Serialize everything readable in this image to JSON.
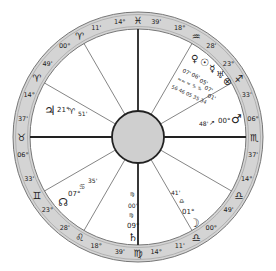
{
  "wheel": {
    "center": [
      138,
      137
    ],
    "outer_radius": 125,
    "inner_radius": 108,
    "hub_radius": 26,
    "ring_color": "#d4d4d4",
    "hub_color": "#cfcfcf"
  },
  "cusps": [
    {
      "id": "mc",
      "angle": 90,
      "heavy": true,
      "deg": "14°",
      "sign": "♓",
      "min": "39'"
    },
    {
      "id": "c11",
      "angle": 60,
      "heavy": false,
      "deg": "18°",
      "sign": "♒",
      "min": "28'"
    },
    {
      "id": "c12",
      "angle": 30,
      "heavy": false,
      "deg": "23°",
      "sign": "♐",
      "min": "33'"
    },
    {
      "id": "dsc",
      "angle": 0,
      "heavy": true,
      "deg": "06°",
      "sign": "♏",
      "min": "37'"
    },
    {
      "id": "c2r",
      "angle": -30,
      "heavy": false,
      "deg": "14°",
      "sign": "♎",
      "min": "49'"
    },
    {
      "id": "c3r",
      "angle": -60,
      "heavy": false,
      "deg": "00°",
      "sign": "♎",
      "min": "11'"
    },
    {
      "id": "ic",
      "angle": -90,
      "heavy": true,
      "deg": "14°",
      "sign": "♍",
      "min": "39'"
    },
    {
      "id": "c5",
      "angle": -120,
      "heavy": false,
      "deg": "18°",
      "sign": "♌",
      "min": "28'"
    },
    {
      "id": "c6",
      "angle": -150,
      "heavy": false,
      "deg": "23°",
      "sign": "♊",
      "min": "33'"
    },
    {
      "id": "asc",
      "angle": 180,
      "heavy": true,
      "deg": "06°",
      "sign": "♉",
      "min": "37'"
    },
    {
      "id": "c8",
      "angle": 150,
      "heavy": false,
      "deg": "14°",
      "sign": "♈",
      "min": "49'"
    },
    {
      "id": "c9",
      "angle": 120,
      "heavy": false,
      "deg": "00°",
      "sign": "♈",
      "min": "11'"
    }
  ],
  "planets": [
    {
      "name": "Jupiter",
      "glyph": "♃",
      "x": 44,
      "y": 112,
      "pos": "21° ♈ 51'"
    },
    {
      "name": "Mars",
      "glyph": "♂",
      "x": 235,
      "y": 100,
      "pos": "48' ↗ 00°"
    },
    {
      "name": "Moon",
      "glyph": "☽",
      "x": 193,
      "y": 220,
      "pos": "01° ♎ 41'"
    },
    {
      "name": "Saturn",
      "glyph": "♄",
      "x": 133,
      "y": 236,
      "pos": "09° ♍ 00'"
    },
    {
      "name": "North Node",
      "glyph": "☊",
      "x": 63,
      "y": 200,
      "pos": "07° ♋ 35'"
    },
    {
      "name": "Venus",
      "glyph": "♀",
      "x": 193,
      "y": 57,
      "pos": "07° ♒"
    },
    {
      "name": "Sun",
      "glyph": "☉",
      "x": 203,
      "y": 62,
      "pos": "06° ♒"
    },
    {
      "name": "Mercury",
      "glyph": "☿",
      "x": 212,
      "y": 69,
      "pos": "05° ♒"
    },
    {
      "name": "Uranus",
      "glyph": "♅",
      "x": 219,
      "y": 75,
      "pos": "07° ♑"
    },
    {
      "name": "Fortune",
      "glyph": "⊗",
      "x": 226,
      "y": 82,
      "pos": "01° ♑"
    }
  ],
  "texts": {
    "jup_deg": "21°",
    "jup_sign": "♈",
    "jup_min": "51'",
    "mars_min": "48'",
    "mars_arrow": "↗",
    "mars_deg": "00°",
    "moon_min": "41'",
    "moon_sign": "♎",
    "moon_deg": "01°",
    "sat_sign_top": "♍",
    "sat_min": "00'",
    "sat_sign": "♍",
    "sat_deg": "09°",
    "node_deg": "07°",
    "node_sign": "♋",
    "node_min": "35'",
    "stellium_a": "07'",
    "stellium_b": "06'",
    "stellium_c": "05'",
    "stellium_d": "07'",
    "stellium_e": "01'",
    "stellium_signs": "≈≈ ≈ ♑ ♑",
    "stellium_mins": "56 46 05 35 34"
  }
}
